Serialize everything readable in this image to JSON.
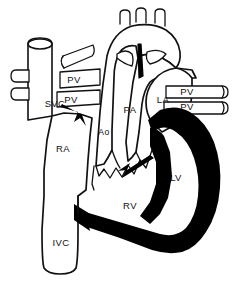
{
  "diagram": {
    "style": "black and white line drawing with solid black left ventricle",
    "colors": {
      "background": "#ffffff",
      "outline": "#111111",
      "filled_chamber": "#000000"
    },
    "labels": [
      {
        "id": "svc",
        "text": "SVC",
        "full_name": "superior vena cava",
        "x": 55,
        "y": 104,
        "size": "normal"
      },
      {
        "id": "pv-1",
        "text": "PV",
        "full_name": "pulmonary vein",
        "x": 74,
        "y": 80,
        "size": "normal"
      },
      {
        "id": "pv-2",
        "text": "PV",
        "full_name": "pulmonary vein",
        "x": 71,
        "y": 100,
        "size": "normal"
      },
      {
        "id": "pv-3",
        "text": "PV",
        "full_name": "pulmonary vein",
        "x": 187,
        "y": 92,
        "size": "normal"
      },
      {
        "id": "pv-4",
        "text": "PV",
        "full_name": "pulmonary vein",
        "x": 187,
        "y": 107,
        "size": "normal"
      },
      {
        "id": "ra",
        "text": "RA",
        "full_name": "right atrium",
        "x": 63,
        "y": 149,
        "size": "normal"
      },
      {
        "id": "ivc",
        "text": "IVC",
        "full_name": "inferior vena cava",
        "x": 61,
        "y": 243,
        "size": "normal"
      },
      {
        "id": "ao",
        "text": "Ao",
        "full_name": "aorta",
        "x": 104,
        "y": 133,
        "size": "small"
      },
      {
        "id": "pa",
        "text": "PA",
        "full_name": "pulmonary artery",
        "x": 130,
        "y": 110,
        "size": "normal"
      },
      {
        "id": "la",
        "text": "LA",
        "full_name": "left atrium",
        "x": 163,
        "y": 100,
        "size": "normal"
      },
      {
        "id": "lv",
        "text": "LV",
        "full_name": "left ventricle",
        "x": 176,
        "y": 178,
        "size": "normal"
      },
      {
        "id": "rv",
        "text": "RV",
        "full_name": "right ventricle",
        "x": 130,
        "y": 206,
        "size": "normal"
      }
    ],
    "flow_arrows": [
      {
        "id": "arrow-pv-to-la",
        "description": "flow arrow near pulmonary veins entering heart"
      },
      {
        "id": "arrow-av-valve",
        "description": "flow arrow through atrioventricular valve toward ventricle"
      },
      {
        "id": "arrow-apex",
        "description": "arrowhead at ventricular apex pointing up-left"
      }
    ]
  }
}
